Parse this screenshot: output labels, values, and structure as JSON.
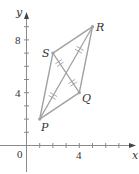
{
  "diagram": {
    "axes": {
      "x_label": "x",
      "y_label": "y",
      "origin_label": "0",
      "x_tick_labels": [
        {
          "value": 4,
          "label": "4"
        }
      ],
      "y_tick_labels": [
        {
          "value": 4,
          "label": "4"
        },
        {
          "value": 8,
          "label": "8"
        }
      ],
      "x_ticks": [
        1,
        2,
        3,
        4,
        5,
        6,
        7
      ],
      "y_ticks": [
        1,
        2,
        3,
        4,
        5,
        6,
        7,
        8,
        9
      ]
    },
    "points": [
      {
        "name": "P",
        "x": 1,
        "y": 2
      },
      {
        "name": "Q",
        "x": 4,
        "y": 4
      },
      {
        "name": "R",
        "x": 5,
        "y": 9
      },
      {
        "name": "S",
        "x": 2,
        "y": 7
      }
    ],
    "edges": [
      [
        "P",
        "Q"
      ],
      [
        "Q",
        "R"
      ],
      [
        "R",
        "S"
      ],
      [
        "S",
        "P"
      ]
    ],
    "diagonals": [
      [
        "P",
        "R"
      ],
      [
        "S",
        "Q"
      ]
    ],
    "marks": "double hash marks on each half of both diagonals (diagonals bisect each other)",
    "colors": {
      "lines": "#a0a0a0",
      "axes": "#8a8a8a",
      "text": "#333333"
    }
  }
}
